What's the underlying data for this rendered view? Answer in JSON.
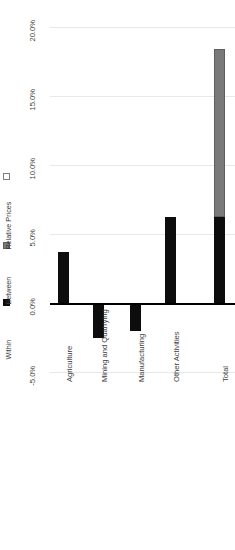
{
  "chart_data": {
    "type": "bar",
    "title": "",
    "subtitle": "",
    "xlabel": "",
    "ylabel": "",
    "orientation": "vertical-rotated-90",
    "stacked": true,
    "grid": true,
    "legend_position": "left",
    "ylim": [
      -5.0,
      20.0
    ],
    "ytick_values": [
      20.0,
      15.0,
      10.0,
      5.0,
      0.0,
      -5.0
    ],
    "ytick_labels": [
      "20.0%",
      "15.0%",
      "10.0%",
      "5.0%",
      "0.0%",
      "-5.0%"
    ],
    "categories": [
      "Agriculture",
      "Mining and Quarrying",
      "Manufacturing",
      "Other Activities",
      "Total"
    ],
    "series": [
      {
        "name": "Within",
        "color": "#0d0d0d",
        "values": [
          3.7,
          -2.5,
          -2.0,
          6.2,
          6.2
        ]
      },
      {
        "name": "Between",
        "color": "#7a7a7a",
        "values": [
          0.0,
          0.0,
          0.0,
          0.0,
          12.2
        ]
      },
      {
        "name": "Relative Prices",
        "color": "#ffffff",
        "values": [
          0.0,
          0.0,
          0.0,
          0.0,
          0.0
        ]
      }
    ],
    "totals": [
      3.7,
      -2.5,
      -2.0,
      6.2,
      18.4
    ]
  },
  "legend": {
    "items": [
      {
        "label": "Within",
        "swatch": "filled-black-square"
      },
      {
        "label": "Between",
        "swatch": "filled-gray-square"
      },
      {
        "label": "Relative Prices",
        "swatch": "outlined-white-square"
      }
    ]
  },
  "axis": {
    "ticks": [
      {
        "label": "20.0%"
      },
      {
        "label": "15.0%"
      },
      {
        "label": "10.0%"
      },
      {
        "label": "5.0%"
      },
      {
        "label": "0.0%"
      },
      {
        "label": "-5.0%"
      }
    ]
  },
  "colors": {
    "within": "#0d0d0d",
    "between": "#7a7a7a",
    "relative_prices": "#ffffff",
    "gridline": "#e8e8e8",
    "axis_line": "#000000",
    "text": "#3d3d3d",
    "background": "#ffffff"
  }
}
